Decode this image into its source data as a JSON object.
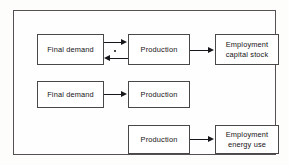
{
  "figure": {
    "frame": {
      "border_color": "#555152",
      "background": "#fefefe"
    },
    "line_color": "#17161a",
    "text_color": "#131213"
  },
  "rows": [
    {
      "id": "row-capital-stock",
      "nodes": {
        "final_demand": "Final demand",
        "production": "Production",
        "outcome": "Employment\ncapital stock"
      },
      "links": {
        "demand_to_production": "Final demand to Production",
        "production_to_demand": "Production to Final demand",
        "production_to_outcome": "Production to Employment capital stock"
      }
    },
    {
      "id": "row-demand-production",
      "nodes": {
        "final_demand": "Final demand",
        "production": "Production"
      },
      "links": {
        "demand_to_production": "Final demand to Production"
      }
    },
    {
      "id": "row-energy-use",
      "nodes": {
        "production": "Production",
        "outcome": "Employment\nenergy use"
      },
      "links": {
        "production_to_outcome": "Production to Employment energy use"
      }
    }
  ]
}
